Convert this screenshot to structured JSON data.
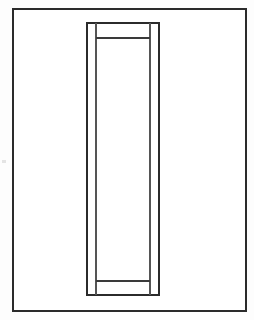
{
  "figure": {
    "background_color": "#ffffff",
    "page_color": "#fdfdfd",
    "line_color": "#2b2b2b",
    "line_color_light": "#555555",
    "canvas": {
      "width": 254,
      "height": 320
    }
  },
  "geometry": {
    "border": {
      "name": "outer-border",
      "x": 13,
      "y": 9,
      "width": 233,
      "height": 302,
      "stroke_width": 1.6,
      "stroke": "#2b2b2b"
    },
    "panel_frame": {
      "name": "panel-outer-frame",
      "x": 87,
      "y": 23,
      "width": 72,
      "height": 272,
      "stroke_width": 1.3,
      "stroke": "#2b2b2b"
    },
    "stiles": [
      {
        "name": "left-stile",
        "x1": 96,
        "y1": 23,
        "x2": 96,
        "y2": 295,
        "stroke_width": 1.1,
        "stroke": "#555555"
      },
      {
        "name": "right-stile",
        "x1": 150,
        "y1": 23,
        "x2": 150,
        "y2": 295,
        "stroke_width": 1.1,
        "stroke": "#555555"
      }
    ],
    "rails": [
      {
        "name": "top-rail",
        "x1": 96,
        "y1": 38,
        "x2": 150,
        "y2": 38,
        "stroke_width": 1.2,
        "stroke": "#3a3a3a"
      },
      {
        "name": "bottom-rail",
        "x1": 96,
        "y1": 281,
        "x2": 150,
        "y2": 281,
        "stroke_width": 1.2,
        "stroke": "#3a3a3a"
      }
    ],
    "artifacts": [
      {
        "name": "left-margin-speck",
        "x": 2,
        "y": 160,
        "width": 4,
        "height": 3
      }
    ]
  }
}
